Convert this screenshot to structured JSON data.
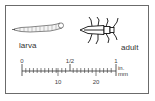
{
  "figure": {
    "labels": {
      "larva": "larva",
      "adult": "adult"
    },
    "scale": {
      "inch_ticks": [
        {
          "label": "0",
          "x": 22
        },
        {
          "label": "1/2",
          "x": 70
        },
        {
          "label": "1",
          "x": 116
        }
      ],
      "mm_ticks": [
        {
          "label": "10",
          "x": 58
        },
        {
          "label": "20",
          "x": 96
        }
      ],
      "inch_unit": "in.",
      "mm_unit": "mm"
    },
    "colors": {
      "line": "#333333",
      "frame": "#6b6b6b",
      "background": "#ffffff"
    }
  }
}
